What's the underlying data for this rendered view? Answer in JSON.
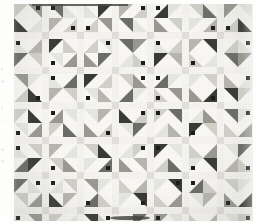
{
  "image": {
    "subject": "patchwork quilt photograph",
    "description": "Scanned page showing a full view of a pieced quilt made of repeating pinwheel / half-square-triangle blocks set with pale sashing strips and darker cornerstone squares.",
    "background_color": "#fdfdfc"
  },
  "margin_text": {
    "note": "faint cut-off text fragments at the left page edge",
    "color": "#b9b9b6",
    "fragments": [
      {
        "text": "r",
        "top": 66
      },
      {
        "text": "o",
        "top": 78
      },
      {
        "text": "t",
        "top": 104
      },
      {
        "text": "-",
        "top": 118
      },
      {
        "text": "e",
        "top": 146
      },
      {
        "text": "s",
        "top": 158
      },
      {
        "text": ".",
        "top": 172
      }
    ]
  },
  "quilt": {
    "left": 14,
    "top": 4,
    "width": 239,
    "height": 217,
    "ground_color": "#faf9f5",
    "sashing_color": "#f6f5f1",
    "cornerstone_color": "#e2e1db",
    "binding_color": "#4a4a48",
    "columns": 7,
    "rows": 7,
    "block_size": 28,
    "sash_width": 7,
    "patch_palette": [
      "#1d1d1b",
      "#3a3a37",
      "#6e6e69",
      "#9a9a93",
      "#b8b8b1",
      "#d2d2cb",
      "#e8e8e2"
    ],
    "blocks": [
      {
        "row": 0,
        "col": 0,
        "tones": [
          5,
          3,
          1,
          6
        ],
        "dirs": [
          "tl",
          "tr",
          "bl",
          "br"
        ],
        "dots": [
          1
        ]
      },
      {
        "row": 0,
        "col": 1,
        "tones": [
          2,
          6,
          4,
          5
        ],
        "dirs": [
          "tr",
          "bl",
          "tl",
          "br"
        ],
        "dots": [
          0,
          3
        ]
      },
      {
        "row": 0,
        "col": 2,
        "tones": [
          6,
          1,
          5,
          3
        ],
        "dirs": [
          "bl",
          "tl",
          "br",
          "tr"
        ],
        "dots": [
          2
        ]
      },
      {
        "row": 0,
        "col": 3,
        "tones": [
          4,
          5,
          2,
          6
        ],
        "dirs": [
          "tl",
          "br",
          "tr",
          "bl"
        ],
        "dots": [
          1
        ]
      },
      {
        "row": 0,
        "col": 4,
        "tones": [
          1,
          6,
          3,
          5
        ],
        "dirs": [
          "br",
          "tl",
          "bl",
          "tr"
        ],
        "dots": [
          0
        ]
      },
      {
        "row": 0,
        "col": 5,
        "tones": [
          5,
          2,
          6,
          4
        ],
        "dirs": [
          "tr",
          "bl",
          "tl",
          "br"
        ],
        "dots": [
          3
        ]
      },
      {
        "row": 0,
        "col": 6,
        "tones": [
          3,
          6,
          5,
          1
        ],
        "dirs": [
          "tl",
          "tr",
          "br",
          "bl"
        ],
        "dots": [
          2
        ]
      },
      {
        "row": 1,
        "col": 0,
        "tones": [
          6,
          4,
          2,
          5
        ],
        "dirs": [
          "bl",
          "br",
          "tl",
          "tr"
        ],
        "dots": [
          0
        ]
      },
      {
        "row": 1,
        "col": 1,
        "tones": [
          1,
          5,
          6,
          3
        ],
        "dirs": [
          "tl",
          "bl",
          "tr",
          "br"
        ],
        "dots": [
          2
        ]
      },
      {
        "row": 1,
        "col": 2,
        "tones": [
          5,
          6,
          3,
          2
        ],
        "dirs": [
          "br",
          "tr",
          "bl",
          "tl"
        ],
        "dots": [
          1
        ]
      },
      {
        "row": 1,
        "col": 3,
        "tones": [
          2,
          3,
          6,
          5
        ],
        "dirs": [
          "tr",
          "tl",
          "br",
          "bl"
        ],
        "dots": [
          3
        ]
      },
      {
        "row": 1,
        "col": 4,
        "tones": [
          6,
          5,
          1,
          4
        ],
        "dirs": [
          "bl",
          "br",
          "tl",
          "tr"
        ],
        "dots": [
          0
        ]
      },
      {
        "row": 1,
        "col": 5,
        "tones": [
          4,
          1,
          5,
          6
        ],
        "dirs": [
          "tl",
          "tr",
          "bl",
          "br"
        ],
        "dots": [
          2
        ]
      },
      {
        "row": 1,
        "col": 6,
        "tones": [
          5,
          6,
          2,
          3
        ],
        "dirs": [
          "br",
          "bl",
          "tr",
          "tl"
        ],
        "dots": [
          1
        ]
      },
      {
        "row": 2,
        "col": 0,
        "tones": [
          3,
          6,
          5,
          1
        ],
        "dirs": [
          "tr",
          "tl",
          "br",
          "bl"
        ],
        "dots": [
          3
        ]
      },
      {
        "row": 2,
        "col": 1,
        "tones": [
          6,
          2,
          4,
          5
        ],
        "dirs": [
          "bl",
          "br",
          "tl",
          "tr"
        ],
        "dots": [
          0
        ]
      },
      {
        "row": 2,
        "col": 2,
        "tones": [
          1,
          5,
          6,
          4
        ],
        "dirs": [
          "tl",
          "br",
          "tr",
          "bl"
        ],
        "dots": [
          2
        ]
      },
      {
        "row": 2,
        "col": 3,
        "tones": [
          5,
          3,
          2,
          6
        ],
        "dirs": [
          "tr",
          "bl",
          "br",
          "tl"
        ],
        "dots": [
          1
        ]
      },
      {
        "row": 2,
        "col": 4,
        "tones": [
          2,
          6,
          5,
          3
        ],
        "dirs": [
          "br",
          "tl",
          "bl",
          "tr"
        ],
        "dots": [
          0,
          2
        ]
      },
      {
        "row": 2,
        "col": 5,
        "tones": [
          6,
          5,
          3,
          1
        ],
        "dirs": [
          "tl",
          "tr",
          "bl",
          "br"
        ],
        "dots": [
          3
        ]
      },
      {
        "row": 2,
        "col": 6,
        "tones": [
          4,
          6,
          1,
          5
        ],
        "dirs": [
          "bl",
          "br",
          "tr",
          "tl"
        ],
        "dots": [
          1
        ]
      },
      {
        "row": 3,
        "col": 0,
        "tones": [
          5,
          1,
          6,
          3
        ],
        "dirs": [
          "tl",
          "bl",
          "tr",
          "br"
        ],
        "dots": [
          2
        ]
      },
      {
        "row": 3,
        "col": 1,
        "tones": [
          3,
          6,
          5,
          2
        ],
        "dirs": [
          "br",
          "tr",
          "tl",
          "bl"
        ],
        "dots": [
          0
        ]
      },
      {
        "row": 3,
        "col": 2,
        "tones": [
          6,
          4,
          3,
          5
        ],
        "dirs": [
          "tr",
          "tl",
          "bl",
          "br"
        ],
        "dots": [
          3
        ]
      },
      {
        "row": 3,
        "col": 3,
        "tones": [
          1,
          5,
          6,
          2
        ],
        "dirs": [
          "bl",
          "br",
          "tr",
          "tl"
        ],
        "dots": [
          1
        ]
      },
      {
        "row": 3,
        "col": 4,
        "tones": [
          5,
          2,
          6,
          4
        ],
        "dirs": [
          "tl",
          "tr",
          "br",
          "bl"
        ],
        "dots": [
          0
        ]
      },
      {
        "row": 3,
        "col": 5,
        "tones": [
          6,
          3,
          1,
          5
        ],
        "dirs": [
          "br",
          "bl",
          "tl",
          "tr"
        ],
        "dots": [
          2
        ]
      },
      {
        "row": 3,
        "col": 6,
        "tones": [
          2,
          6,
          5,
          3
        ],
        "dirs": [
          "tr",
          "tl",
          "bl",
          "br"
        ],
        "dots": [
          1
        ]
      },
      {
        "row": 4,
        "col": 0,
        "tones": [
          6,
          5,
          2,
          1
        ],
        "dirs": [
          "bl",
          "tr",
          "br",
          "tl"
        ],
        "dots": [
          0
        ]
      },
      {
        "row": 4,
        "col": 1,
        "tones": [
          4,
          6,
          5,
          3
        ],
        "dirs": [
          "tl",
          "br",
          "tr",
          "bl"
        ],
        "dots": [
          2
        ]
      },
      {
        "row": 4,
        "col": 2,
        "tones": [
          5,
          1,
          6,
          2
        ],
        "dirs": [
          "tr",
          "bl",
          "tl",
          "br"
        ],
        "dots": [
          3
        ]
      },
      {
        "row": 4,
        "col": 3,
        "tones": [
          6,
          5,
          3,
          4
        ],
        "dirs": [
          "br",
          "tl",
          "bl",
          "tr"
        ],
        "dots": [
          1
        ]
      },
      {
        "row": 4,
        "col": 4,
        "tones": [
          1,
          6,
          5,
          2
        ],
        "dirs": [
          "tl",
          "tr",
          "br",
          "bl"
        ],
        "dots": [
          0
        ]
      },
      {
        "row": 4,
        "col": 5,
        "tones": [
          5,
          3,
          6,
          1
        ],
        "dirs": [
          "bl",
          "br",
          "tl",
          "tr"
        ],
        "dots": [
          2
        ]
      },
      {
        "row": 4,
        "col": 6,
        "tones": [
          6,
          2,
          4,
          5
        ],
        "dirs": [
          "tr",
          "tl",
          "br",
          "bl"
        ],
        "dots": [
          3
        ]
      },
      {
        "row": 5,
        "col": 0,
        "tones": [
          2,
          6,
          5,
          3
        ],
        "dirs": [
          "tl",
          "bl",
          "tr",
          "br"
        ],
        "dots": [
          1
        ]
      },
      {
        "row": 5,
        "col": 1,
        "tones": [
          6,
          5,
          1,
          4
        ],
        "dirs": [
          "br",
          "tr",
          "bl",
          "tl"
        ],
        "dots": [
          0
        ]
      },
      {
        "row": 5,
        "col": 2,
        "tones": [
          3,
          6,
          2,
          5
        ],
        "dirs": [
          "tr",
          "tl",
          "br",
          "bl"
        ],
        "dots": [
          2
        ]
      },
      {
        "row": 5,
        "col": 3,
        "tones": [
          5,
          4,
          6,
          1
        ],
        "dirs": [
          "bl",
          "br",
          "tl",
          "tr"
        ],
        "dots": [
          3
        ]
      },
      {
        "row": 5,
        "col": 4,
        "tones": [
          6,
          1,
          5,
          3
        ],
        "dirs": [
          "tl",
          "tr",
          "bl",
          "br"
        ],
        "dots": [
          1
        ]
      },
      {
        "row": 5,
        "col": 5,
        "tones": [
          2,
          5,
          6,
          4
        ],
        "dirs": [
          "br",
          "bl",
          "tr",
          "tl"
        ],
        "dots": [
          0
        ]
      },
      {
        "row": 5,
        "col": 6,
        "tones": [
          5,
          6,
          3,
          1
        ],
        "dirs": [
          "tr",
          "tl",
          "bl",
          "br"
        ],
        "dots": [
          2
        ]
      },
      {
        "row": 6,
        "col": 0,
        "tones": [
          6,
          3,
          5,
          2
        ],
        "dirs": [
          "bl",
          "tr",
          "tl",
          "br"
        ],
        "dots": [
          0
        ]
      },
      {
        "row": 6,
        "col": 1,
        "tones": [
          5,
          6,
          4,
          1
        ],
        "dirs": [
          "tl",
          "br",
          "bl",
          "tr"
        ],
        "dots": [
          2
        ]
      },
      {
        "row": 6,
        "col": 2,
        "tones": [
          1,
          5,
          6,
          3
        ],
        "dirs": [
          "tr",
          "bl",
          "br",
          "tl"
        ],
        "dots": [
          1
        ]
      },
      {
        "row": 6,
        "col": 3,
        "tones": [
          6,
          2,
          5,
          4
        ],
        "dirs": [
          "br",
          "tl",
          "tr",
          "bl"
        ],
        "dots": [
          3
        ]
      },
      {
        "row": 6,
        "col": 4,
        "tones": [
          3,
          6,
          1,
          5
        ],
        "dirs": [
          "tl",
          "tr",
          "bl",
          "br"
        ],
        "dots": [
          0
        ]
      },
      {
        "row": 6,
        "col": 5,
        "tones": [
          5,
          4,
          6,
          2
        ],
        "dirs": [
          "bl",
          "br",
          "tr",
          "tl"
        ],
        "dots": [
          2
        ]
      },
      {
        "row": 6,
        "col": 6,
        "tones": [
          6,
          5,
          3,
          1
        ],
        "dirs": [
          "tr",
          "tl",
          "br",
          "bl"
        ],
        "dots": [
          1
        ]
      }
    ]
  }
}
